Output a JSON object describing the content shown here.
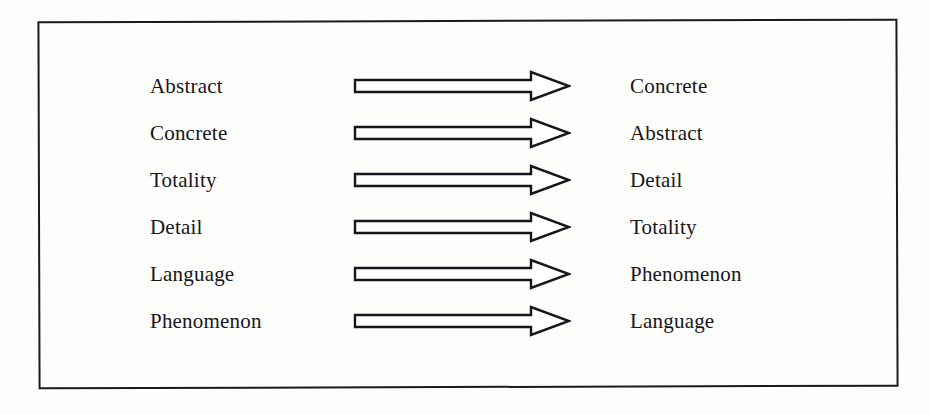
{
  "page": {
    "background_color": "#fdfdfb",
    "frame_color": "#1b1b1b",
    "text_color": "#16161a",
    "arrow_fill": "#ffffff",
    "arrow_stroke": "#15151a"
  },
  "diagram": {
    "type": "paired-arrow-list",
    "arrow_icon_name": "right-arrow-outline-icon",
    "row_count": 6,
    "rows": [
      {
        "left": "Abstract",
        "right": "Concrete"
      },
      {
        "left": "Concrete",
        "right": "Abstract"
      },
      {
        "left": "Totality",
        "right": "Detail"
      },
      {
        "left": "Detail",
        "right": "Totality"
      },
      {
        "left": "Language",
        "right": "Phenomenon"
      },
      {
        "left": "Phenomenon",
        "right": "Language"
      }
    ]
  }
}
